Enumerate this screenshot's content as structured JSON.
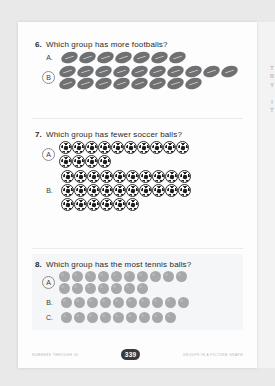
{
  "page": {
    "side_tab_label": "TRY IT",
    "page_number": "339",
    "footer_left": "NUMBERS THROUGH 20",
    "footer_right": "GROUPS IN A PICTURE GRAPH"
  },
  "questions": [
    {
      "number": "6.",
      "text": "Which group has more footballs?",
      "icon": "football-icon",
      "groups": [
        {
          "label": "A.",
          "circled": false,
          "rows": [
            7
          ]
        },
        {
          "label": "B",
          "circled": true,
          "rows": [
            10,
            8
          ]
        }
      ]
    },
    {
      "number": "7.",
      "text": "Which group has fewer soccer balls?",
      "icon": "soccer-ball-icon",
      "groups": [
        {
          "label": "A",
          "circled": true,
          "rows": [
            10,
            4
          ]
        },
        {
          "label": "B.",
          "circled": false,
          "rows": [
            10,
            10,
            6
          ]
        }
      ]
    },
    {
      "number": "8.",
      "text": "Which group has the most tennis balls?",
      "icon": "tennis-ball-icon",
      "groups": [
        {
          "label": "A",
          "circled": true,
          "rows": [
            10,
            7
          ]
        },
        {
          "label": "B.",
          "circled": false,
          "rows": [
            10
          ]
        },
        {
          "label": "C.",
          "circled": false,
          "rows": [
            9
          ]
        }
      ]
    }
  ]
}
